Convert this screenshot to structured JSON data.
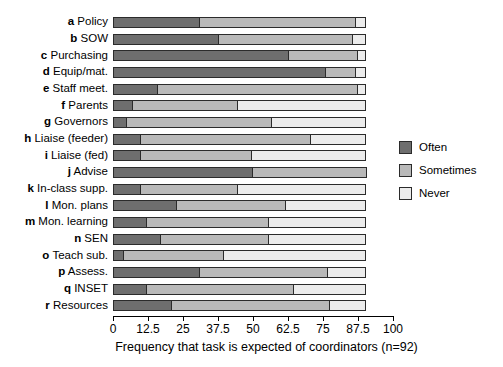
{
  "chart_data": {
    "type": "bar",
    "orientation": "horizontal",
    "stacked": true,
    "title": "",
    "xlabel": "Frequency that task is expected of coordinators (n=92)",
    "ylabel": "",
    "xlim": [
      0,
      100
    ],
    "xticks": [
      0,
      12.5,
      25,
      37.5,
      50,
      62.5,
      75,
      87.5,
      100
    ],
    "xtick_labels": [
      "0",
      "12.5",
      "25",
      "37.5",
      "50",
      "62.5",
      "75",
      "87.5",
      "100"
    ],
    "grid": false,
    "legend_position": "right",
    "categories": [
      "a Policy",
      "b SOW",
      "c Purchasing",
      "d Equip/mat.",
      "e Staff meet.",
      "f Parents",
      "g Governors",
      "h Liaise (feeder)",
      "i Liaise (fed)",
      "j Advise",
      "k In-class supp.",
      "l Mon. plans",
      "m Mon. learning",
      "n SEN",
      "o Teach sub.",
      "p Assess.",
      "q INSET",
      "r Resources"
    ],
    "category_keys": [
      "a",
      "b",
      "c",
      "d",
      "e",
      "f",
      "g",
      "h",
      "i",
      "j",
      "k",
      "l",
      "m",
      "n",
      "o",
      "p",
      "q",
      "r"
    ],
    "category_labels": [
      "Policy",
      "SOW",
      "Purchasing",
      "Equip/mat.",
      "Staff meet.",
      "Parents",
      "Governors",
      "Liaise (feeder)",
      "Liaise (fed)",
      "Advise",
      "In-class supp.",
      "Mon. plans",
      "Mon. learning",
      "SEN",
      "Teach sub.",
      "Assess.",
      "INSET",
      "Resources"
    ],
    "series": [
      {
        "name": "Often",
        "color": "#6e6e6e",
        "values": [
          31,
          38,
          63,
          76,
          16,
          7,
          5,
          10,
          10,
          50,
          10,
          23,
          12,
          17,
          4,
          31,
          12,
          21
        ]
      },
      {
        "name": "Sometimes",
        "color": "#b9b9b9",
        "values": [
          56,
          48,
          25,
          11,
          72,
          38,
          52,
          61,
          40,
          41,
          35,
          39,
          44,
          39,
          36,
          46,
          53,
          57
        ]
      },
      {
        "name": "Never",
        "color": "#ececec",
        "values": [
          4,
          5,
          3,
          4,
          3,
          46,
          34,
          20,
          41,
          0,
          46,
          29,
          35,
          35,
          51,
          14,
          26,
          13
        ]
      }
    ],
    "totals": [
      91,
      91,
      91,
      91,
      91,
      91,
      91,
      91,
      91,
      91,
      91,
      91,
      91,
      91,
      91,
      91,
      91,
      91
    ]
  },
  "legend": {
    "items": [
      {
        "label": "Often",
        "color": "#6e6e6e"
      },
      {
        "label": "Sometimes",
        "color": "#b9b9b9"
      },
      {
        "label": "Never",
        "color": "#ececec"
      }
    ]
  }
}
